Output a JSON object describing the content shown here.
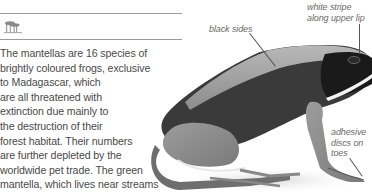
{
  "header": {
    "habitat_icon": "forest-habitat-icon"
  },
  "body": {
    "lines": [
      "The mantellas are 16 species of",
      "brightly coloured frogs, exclusive",
      "to Madagascar, which",
      "are all threatened with",
      "extinction due mainly to",
      "the destruction of their",
      "forest habitat. Their numbers",
      "are further depleted by the",
      "worldwide pet trade. The green",
      "mantella, which lives near streams"
    ]
  },
  "figure": {
    "annotations": {
      "black_sides": [
        "black sides"
      ],
      "white_stripe": [
        "white stripe",
        "along upper lip"
      ],
      "adhesive_discs": [
        "adhesive",
        "discs on",
        "toes"
      ]
    }
  },
  "colors": {
    "text": "#4a4a4a",
    "rule": "#9a9a9a",
    "icon": "#8a8a8a",
    "label": "#6a6a6a"
  }
}
